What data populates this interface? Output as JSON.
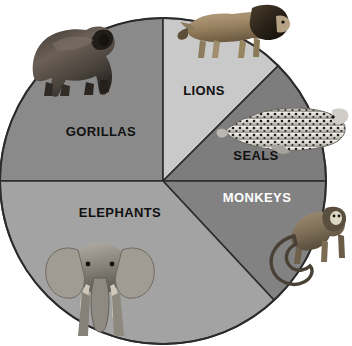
{
  "figure": {
    "type": "pie-chart-illustration",
    "background_color": "#ffffff",
    "outline_color": "#2b2b2b"
  },
  "chart_data": {
    "type": "pie",
    "title": "",
    "subtitle": "",
    "xlabel": "",
    "ylabel": "",
    "grid": false,
    "legend_position": "none",
    "labels_on_slices": true,
    "start_angle_deg": 0,
    "direction": "clockwise",
    "center": {
      "x": 163,
      "y": 181,
      "radius": 163
    },
    "categories": [
      "GORILLAS",
      "LIONS",
      "SEALS",
      "MONKEYS",
      "ELEPHANTS"
    ],
    "values": [
      25,
      12.5,
      12.5,
      13,
      37
    ],
    "units": "percent",
    "slices": [
      {
        "label": "GORILLAS",
        "value": 25,
        "start_deg": 270,
        "end_deg": 360,
        "color": "#8a8a8a",
        "label_color": "#111111",
        "label_x": 101,
        "label_y": 131,
        "label_size": 13,
        "animal": "gorilla"
      },
      {
        "label": "LIONS",
        "value": 12.5,
        "start_deg": 0,
        "end_deg": 45,
        "color": "#c9c9c9",
        "label_color": "#111111",
        "label_x": 204,
        "label_y": 90,
        "label_size": 13,
        "animal": "lion"
      },
      {
        "label": "SEALS",
        "value": 12.5,
        "start_deg": 45,
        "end_deg": 90,
        "color": "#7d7d7d",
        "label_color": "#111111",
        "label_x": 256,
        "label_y": 155,
        "label_size": 13,
        "animal": "seal"
      },
      {
        "label": "MONKEYS",
        "value": 13,
        "start_deg": 90,
        "end_deg": 137,
        "color": "#828282",
        "label_color": "#ffffff",
        "label_x": 257,
        "label_y": 197,
        "label_size": 13,
        "animal": "monkey"
      },
      {
        "label": "ELEPHANTS",
        "value": 37,
        "start_deg": 137,
        "end_deg": 270,
        "color": "#a3a3a3",
        "label_color": "#111111",
        "label_x": 120,
        "label_y": 212,
        "label_size": 13,
        "animal": "elephant"
      }
    ]
  },
  "artwork": {
    "gorilla": {
      "x": 12,
      "y": 6,
      "w": 104,
      "h": 90
    },
    "lion": {
      "x": 176,
      "y": 2,
      "w": 112,
      "h": 62
    },
    "seal": {
      "x": 222,
      "y": 102,
      "w": 126,
      "h": 52
    },
    "monkey": {
      "x": 252,
      "y": 200,
      "w": 92,
      "h": 90
    },
    "elephant": {
      "x": 44,
      "y": 236,
      "w": 96,
      "h": 108
    }
  }
}
